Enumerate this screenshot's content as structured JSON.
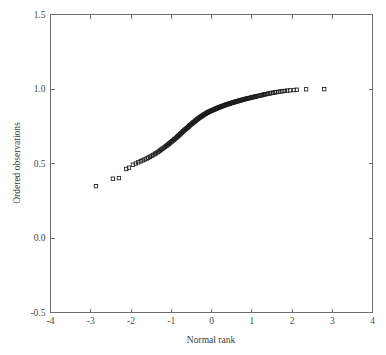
{
  "chart_data": {
    "type": "scatter",
    "title": "",
    "subtitle": "",
    "xlabel": "Normal rank",
    "ylabel": "Ordered observations",
    "xlim": [
      -4,
      4
    ],
    "ylim": [
      -0.5,
      1.5
    ],
    "xticks": [
      -4,
      -3,
      -2,
      -1,
      0,
      1,
      2,
      3,
      4
    ],
    "xticklabels": [
      "-4",
      "-3",
      "-2",
      "-1",
      "0",
      "1",
      "2",
      "3",
      "4"
    ],
    "yticks": [
      -0.5,
      0.0,
      0.5,
      1.0,
      1.5
    ],
    "yticklabels": [
      "-0.5",
      "0.0",
      "0.5",
      "1.0",
      "1.5"
    ],
    "grid": false,
    "legend": null,
    "marker": "open-square",
    "marker_color": "#1c1c1c",
    "marker_size": 3.4,
    "annotations": [],
    "series": [
      {
        "name": "Ordered observations vs normal rank",
        "points": [
          [
            -2.87,
            0.348
          ],
          [
            -2.45,
            0.398
          ],
          [
            -2.3,
            0.402
          ],
          [
            -2.12,
            0.463
          ],
          [
            -2.05,
            0.472
          ],
          [
            -1.95,
            0.492
          ],
          [
            -1.88,
            0.5
          ],
          [
            -1.82,
            0.508
          ],
          [
            -1.76,
            0.515
          ],
          [
            -1.71,
            0.521
          ],
          [
            -1.66,
            0.527
          ],
          [
            -1.61,
            0.533
          ],
          [
            -1.57,
            0.539
          ],
          [
            -1.53,
            0.545
          ],
          [
            -1.49,
            0.551
          ],
          [
            -1.45,
            0.557
          ],
          [
            -1.41,
            0.563
          ],
          [
            -1.38,
            0.569
          ],
          [
            -1.34,
            0.575
          ],
          [
            -1.31,
            0.581
          ],
          [
            -1.28,
            0.587
          ],
          [
            -1.25,
            0.593
          ],
          [
            -1.22,
            0.599
          ],
          [
            -1.19,
            0.605
          ],
          [
            -1.16,
            0.611
          ],
          [
            -1.13,
            0.617
          ],
          [
            -1.1,
            0.622
          ],
          [
            -1.08,
            0.628
          ],
          [
            -1.05,
            0.633
          ],
          [
            -1.03,
            0.639
          ],
          [
            -1.0,
            0.644
          ],
          [
            -0.98,
            0.65
          ],
          [
            -0.95,
            0.655
          ],
          [
            -0.93,
            0.661
          ],
          [
            -0.91,
            0.666
          ],
          [
            -0.88,
            0.671
          ],
          [
            -0.86,
            0.677
          ],
          [
            -0.84,
            0.682
          ],
          [
            -0.82,
            0.687
          ],
          [
            -0.8,
            0.692
          ],
          [
            -0.78,
            0.697
          ],
          [
            -0.76,
            0.702
          ],
          [
            -0.74,
            0.707
          ],
          [
            -0.72,
            0.712
          ],
          [
            -0.7,
            0.717
          ],
          [
            -0.68,
            0.722
          ],
          [
            -0.66,
            0.727
          ],
          [
            -0.64,
            0.731
          ],
          [
            -0.62,
            0.736
          ],
          [
            -0.6,
            0.74
          ],
          [
            -0.58,
            0.745
          ],
          [
            -0.56,
            0.749
          ],
          [
            -0.55,
            0.754
          ],
          [
            -0.53,
            0.758
          ],
          [
            -0.51,
            0.762
          ],
          [
            -0.49,
            0.766
          ],
          [
            -0.47,
            0.77
          ],
          [
            -0.46,
            0.774
          ],
          [
            -0.44,
            0.778
          ],
          [
            -0.42,
            0.782
          ],
          [
            -0.4,
            0.786
          ],
          [
            -0.39,
            0.789
          ],
          [
            -0.37,
            0.793
          ],
          [
            -0.35,
            0.797
          ],
          [
            -0.34,
            0.8
          ],
          [
            -0.32,
            0.803
          ],
          [
            -0.3,
            0.807
          ],
          [
            -0.29,
            0.81
          ],
          [
            -0.27,
            0.813
          ],
          [
            -0.25,
            0.816
          ],
          [
            -0.24,
            0.819
          ],
          [
            -0.22,
            0.822
          ],
          [
            -0.2,
            0.825
          ],
          [
            -0.19,
            0.828
          ],
          [
            -0.17,
            0.831
          ],
          [
            -0.15,
            0.833
          ],
          [
            -0.14,
            0.836
          ],
          [
            -0.12,
            0.839
          ],
          [
            -0.1,
            0.841
          ],
          [
            -0.09,
            0.844
          ],
          [
            -0.07,
            0.846
          ],
          [
            -0.05,
            0.848
          ],
          [
            -0.04,
            0.851
          ],
          [
            -0.02,
            0.853
          ],
          [
            0.0,
            0.855
          ],
          [
            0.02,
            0.857
          ],
          [
            0.04,
            0.859
          ],
          [
            0.05,
            0.861
          ],
          [
            0.07,
            0.863
          ],
          [
            0.09,
            0.865
          ],
          [
            0.1,
            0.867
          ],
          [
            0.12,
            0.869
          ],
          [
            0.14,
            0.871
          ],
          [
            0.15,
            0.873
          ],
          [
            0.17,
            0.875
          ],
          [
            0.19,
            0.877
          ],
          [
            0.2,
            0.878
          ],
          [
            0.22,
            0.88
          ],
          [
            0.24,
            0.882
          ],
          [
            0.25,
            0.884
          ],
          [
            0.27,
            0.885
          ],
          [
            0.29,
            0.887
          ],
          [
            0.3,
            0.889
          ],
          [
            0.32,
            0.89
          ],
          [
            0.34,
            0.892
          ],
          [
            0.35,
            0.894
          ],
          [
            0.37,
            0.895
          ],
          [
            0.39,
            0.897
          ],
          [
            0.4,
            0.898
          ],
          [
            0.42,
            0.9
          ],
          [
            0.44,
            0.901
          ],
          [
            0.46,
            0.903
          ],
          [
            0.47,
            0.904
          ],
          [
            0.49,
            0.906
          ],
          [
            0.51,
            0.907
          ],
          [
            0.53,
            0.909
          ],
          [
            0.55,
            0.91
          ],
          [
            0.56,
            0.912
          ],
          [
            0.58,
            0.913
          ],
          [
            0.6,
            0.915
          ],
          [
            0.62,
            0.916
          ],
          [
            0.64,
            0.918
          ],
          [
            0.66,
            0.919
          ],
          [
            0.68,
            0.921
          ],
          [
            0.7,
            0.922
          ],
          [
            0.72,
            0.924
          ],
          [
            0.74,
            0.925
          ],
          [
            0.76,
            0.927
          ],
          [
            0.78,
            0.928
          ],
          [
            0.8,
            0.93
          ],
          [
            0.82,
            0.931
          ],
          [
            0.84,
            0.933
          ],
          [
            0.86,
            0.934
          ],
          [
            0.88,
            0.936
          ],
          [
            0.91,
            0.937
          ],
          [
            0.93,
            0.939
          ],
          [
            0.95,
            0.94
          ],
          [
            0.98,
            0.942
          ],
          [
            1.0,
            0.943
          ],
          [
            1.03,
            0.945
          ],
          [
            1.05,
            0.947
          ],
          [
            1.08,
            0.948
          ],
          [
            1.1,
            0.95
          ],
          [
            1.13,
            0.952
          ],
          [
            1.16,
            0.953
          ],
          [
            1.19,
            0.955
          ],
          [
            1.22,
            0.957
          ],
          [
            1.25,
            0.959
          ],
          [
            1.28,
            0.961
          ],
          [
            1.31,
            0.963
          ],
          [
            1.34,
            0.965
          ],
          [
            1.38,
            0.967
          ],
          [
            1.41,
            0.969
          ],
          [
            1.45,
            0.971
          ],
          [
            1.49,
            0.973
          ],
          [
            1.53,
            0.975
          ],
          [
            1.57,
            0.977
          ],
          [
            1.61,
            0.979
          ],
          [
            1.66,
            0.981
          ],
          [
            1.71,
            0.983
          ],
          [
            1.76,
            0.985
          ],
          [
            1.82,
            0.987
          ],
          [
            1.88,
            0.989
          ],
          [
            1.95,
            0.991
          ],
          [
            2.05,
            0.993
          ],
          [
            2.12,
            0.995
          ],
          [
            2.35,
            0.998
          ],
          [
            2.8,
            0.999
          ]
        ]
      }
    ]
  },
  "axes": {
    "x_title": "Normal rank",
    "y_title": "Ordered observations"
  }
}
